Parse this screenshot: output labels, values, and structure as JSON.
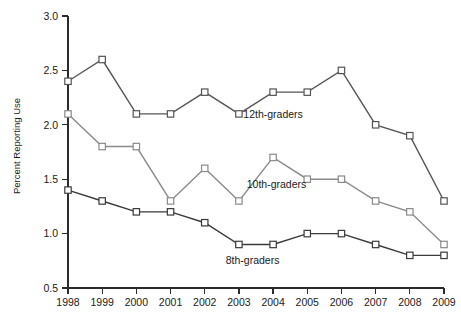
{
  "chart_data": {
    "type": "line",
    "title": "",
    "xlabel": "",
    "ylabel": "Percent Reporting Use",
    "x": [
      1998,
      1999,
      2000,
      2001,
      2002,
      2003,
      2004,
      2005,
      2006,
      2007,
      2008,
      2009
    ],
    "xtick_labels": [
      "1998",
      "1999",
      "2000",
      "2001",
      "2002",
      "2003",
      "2004",
      "2005",
      "2006",
      "2007",
      "2008",
      "2009"
    ],
    "ytick_labels": [
      "0.5",
      "1.0",
      "1.5",
      "2.0",
      "2.5",
      "3.0"
    ],
    "yticks": [
      0.5,
      1.0,
      1.5,
      2.0,
      2.5,
      3.0
    ],
    "ylim": [
      0.5,
      3.0
    ],
    "xlim": [
      1998,
      2009
    ],
    "grid": false,
    "legend_position": "inline-annotations",
    "series": [
      {
        "name": "12th-graders",
        "label": "12th-graders",
        "color": "#555555",
        "marker": "square-open",
        "values": [
          2.4,
          2.6,
          2.1,
          2.1,
          2.3,
          2.1,
          2.3,
          2.3,
          2.5,
          2.0,
          1.9,
          1.3
        ]
      },
      {
        "name": "10th-graders",
        "label": "10th-graders",
        "color": "#8a8a8a",
        "marker": "square-open",
        "values": [
          2.1,
          1.8,
          1.8,
          1.3,
          1.6,
          1.3,
          1.7,
          1.5,
          1.5,
          1.3,
          1.2,
          0.9
        ]
      },
      {
        "name": "8th-graders",
        "label": "8th-graders",
        "color": "#3a3a3a",
        "marker": "square-open",
        "values": [
          1.4,
          1.3,
          1.2,
          1.2,
          1.1,
          0.9,
          0.9,
          1.0,
          1.0,
          0.9,
          0.8,
          0.8
        ]
      }
    ],
    "annotations": [
      {
        "text": "12th-graders",
        "x": 2004.0,
        "y": 2.06
      },
      {
        "text": "10th-graders",
        "x": 2004.1,
        "y": 1.42
      },
      {
        "text": "8th-graders",
        "x": 2003.4,
        "y": 0.72
      }
    ]
  }
}
